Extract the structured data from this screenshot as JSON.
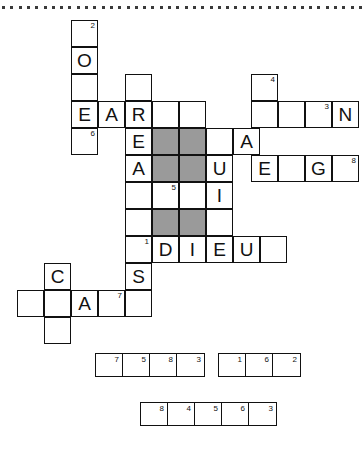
{
  "page": {
    "background_color": "#ffffff",
    "ink_color": "#111111",
    "shaded_cell_color": "#9a9a9a"
  },
  "dotted_rule": {
    "name": "dotted-separator-line",
    "dot_count": 44,
    "dot_color": "#3a3a3a",
    "dot_size": 3,
    "spacing": 8.3,
    "y": 6
  },
  "grid": {
    "cell_size": 27,
    "origin_x": 17,
    "origin_y": 20,
    "columns": [
      17,
      44,
      71,
      98,
      125,
      152,
      179,
      206,
      233,
      260,
      287,
      314,
      341
    ],
    "rows": [
      20,
      47,
      74,
      101,
      128,
      155,
      182,
      209,
      236,
      263,
      290,
      317
    ],
    "cells": [
      {
        "col": 2,
        "row": 0,
        "letter": "",
        "num": "2",
        "shaded": false
      },
      {
        "col": 2,
        "row": 1,
        "letter": "O",
        "num": "",
        "shaded": false
      },
      {
        "col": 2,
        "row": 2,
        "letter": "",
        "num": "",
        "shaded": false
      },
      {
        "col": 4,
        "row": 2,
        "letter": "",
        "num": "",
        "shaded": false
      },
      {
        "col": 8.666,
        "row": 2,
        "letter": "",
        "num": "4",
        "shaded": false
      },
      {
        "col": 2,
        "row": 3,
        "letter": "E",
        "num": "",
        "shaded": false
      },
      {
        "col": 3,
        "row": 3,
        "letter": "A",
        "num": "",
        "shaded": false
      },
      {
        "col": 4,
        "row": 3,
        "letter": "R",
        "num": "",
        "shaded": false
      },
      {
        "col": 5,
        "row": 3,
        "letter": "",
        "num": "",
        "shaded": false
      },
      {
        "col": 6,
        "row": 3,
        "letter": "",
        "num": "",
        "shaded": false
      },
      {
        "col": 8.666,
        "row": 3,
        "letter": "",
        "num": "",
        "shaded": false
      },
      {
        "col": 9.666,
        "row": 3,
        "letter": "",
        "num": "",
        "shaded": false
      },
      {
        "col": 10.666,
        "row": 3,
        "letter": "",
        "num": "3",
        "shaded": false
      },
      {
        "col": 11.666,
        "row": 3,
        "letter": "N",
        "num": "",
        "shaded": false
      },
      {
        "col": 2,
        "row": 4,
        "letter": "",
        "num": "6",
        "shaded": false
      },
      {
        "col": 4,
        "row": 4,
        "letter": "E",
        "num": "",
        "shaded": false
      },
      {
        "col": 5,
        "row": 4,
        "letter": "",
        "num": "",
        "shaded": true
      },
      {
        "col": 6,
        "row": 4,
        "letter": "",
        "num": "",
        "shaded": true
      },
      {
        "col": 7,
        "row": 4,
        "letter": "",
        "num": "",
        "shaded": false
      },
      {
        "col": 8,
        "row": 4,
        "letter": "A",
        "num": "",
        "shaded": false
      },
      {
        "col": 4,
        "row": 5,
        "letter": "A",
        "num": "",
        "shaded": false
      },
      {
        "col": 5,
        "row": 5,
        "letter": "",
        "num": "",
        "shaded": true
      },
      {
        "col": 6,
        "row": 5,
        "letter": "",
        "num": "",
        "shaded": true
      },
      {
        "col": 7,
        "row": 5,
        "letter": "U",
        "num": "",
        "shaded": false
      },
      {
        "col": 8.666,
        "row": 5,
        "letter": "E",
        "num": "",
        "shaded": false
      },
      {
        "col": 9.666,
        "row": 5,
        "letter": "",
        "num": "",
        "shaded": false
      },
      {
        "col": 10.666,
        "row": 5,
        "letter": "G",
        "num": "",
        "shaded": false
      },
      {
        "col": 11.666,
        "row": 5,
        "letter": "",
        "num": "8",
        "shaded": false
      },
      {
        "col": 4,
        "row": 6,
        "letter": "",
        "num": "",
        "shaded": false
      },
      {
        "col": 5,
        "row": 6,
        "letter": "",
        "num": "5",
        "shaded": false
      },
      {
        "col": 6,
        "row": 6,
        "letter": "",
        "num": "",
        "shaded": false
      },
      {
        "col": 7,
        "row": 6,
        "letter": "I",
        "num": "",
        "shaded": false
      },
      {
        "col": 4,
        "row": 7,
        "letter": "",
        "num": "",
        "shaded": false
      },
      {
        "col": 5,
        "row": 7,
        "letter": "",
        "num": "",
        "shaded": true
      },
      {
        "col": 6,
        "row": 7,
        "letter": "",
        "num": "",
        "shaded": true
      },
      {
        "col": 7,
        "row": 7,
        "letter": "",
        "num": "",
        "shaded": false
      },
      {
        "col": 4,
        "row": 8,
        "letter": "",
        "num": "1",
        "shaded": false
      },
      {
        "col": 5,
        "row": 8,
        "letter": "D",
        "num": "",
        "shaded": false
      },
      {
        "col": 6,
        "row": 8,
        "letter": "I",
        "num": "",
        "shaded": false
      },
      {
        "col": 7,
        "row": 8,
        "letter": "E",
        "num": "",
        "shaded": false
      },
      {
        "col": 8,
        "row": 8,
        "letter": "U",
        "num": "",
        "shaded": false
      },
      {
        "col": 9,
        "row": 8,
        "letter": "",
        "num": "",
        "shaded": false
      },
      {
        "col": 1,
        "row": 9,
        "letter": "C",
        "num": "",
        "shaded": false
      },
      {
        "col": 4,
        "row": 9,
        "letter": "S",
        "num": "",
        "shaded": false
      },
      {
        "col": 0,
        "row": 10,
        "letter": "",
        "num": "",
        "shaded": false
      },
      {
        "col": 1,
        "row": 10,
        "letter": "",
        "num": "",
        "shaded": false
      },
      {
        "col": 2,
        "row": 10,
        "letter": "A",
        "num": "",
        "shaded": false
      },
      {
        "col": 3,
        "row": 10,
        "letter": "",
        "num": "7",
        "shaded": false
      },
      {
        "col": 4,
        "row": 10,
        "letter": "",
        "num": "",
        "shaded": false
      },
      {
        "col": 1,
        "row": 11,
        "letter": "",
        "num": "",
        "shaded": false
      }
    ]
  },
  "answer_strips": [
    {
      "name": "answer-strip-1",
      "x": 95,
      "y": 13,
      "numbers": [
        "7",
        "5",
        "8",
        "3"
      ]
    },
    {
      "name": "answer-strip-2",
      "x": 218,
      "y": 13,
      "numbers": [
        "1",
        "6",
        "2"
      ]
    },
    {
      "name": "answer-strip-3",
      "x": 140,
      "y": 62,
      "numbers": [
        "8",
        "4",
        "5",
        "6",
        "3"
      ]
    }
  ]
}
